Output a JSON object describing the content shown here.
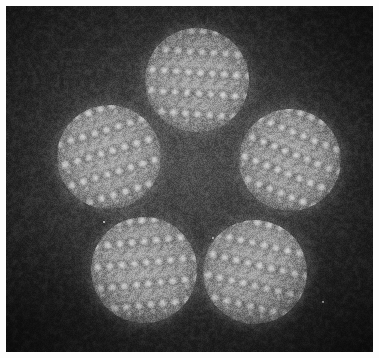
{
  "image": {
    "kind": "electron-micrograph",
    "modality": "high-resolution transmission electron microscopy",
    "subject": "five faceted nanocrystals arranged in a pentagonal cluster, each resolving its atomic lattice",
    "width_px": 379,
    "height_px": 358,
    "frame": {
      "margin_px": 6,
      "margin_color": "#fdfdfd",
      "field_color": "#2b2b2b"
    },
    "tone": {
      "background_gray": "#2b2b2b",
      "background_gray_light": "#3a3a3a",
      "particle_mid_gray": "#a8a8a8",
      "atom_highlight_gray": "#d8d8d8",
      "atom_shadow_gray": "#6a6a6a",
      "brightest": "#e8e8e8",
      "darkest": "#1c1c1c"
    },
    "lattice": {
      "type": "hexagonal",
      "spacing_px": 12,
      "dot_radius_px": 3.2,
      "description": "bright dot array of atomic columns"
    },
    "particles": [
      {
        "id": "particle-top",
        "label": "top nanocrystal",
        "cx": 197,
        "cy": 80,
        "diameter": 104,
        "lattice_rotation_deg": 4,
        "lattice_spacing_px": 12.0
      },
      {
        "id": "particle-left",
        "label": "left nanocrystal",
        "cx": 109,
        "cy": 157,
        "diameter": 104,
        "lattice_rotation_deg": -17,
        "lattice_spacing_px": 12.4
      },
      {
        "id": "particle-right",
        "label": "right nanocrystal",
        "cx": 290,
        "cy": 160,
        "diameter": 102,
        "lattice_rotation_deg": 22,
        "lattice_spacing_px": 11.8
      },
      {
        "id": "particle-bottom-left",
        "label": "bottom-left nanocrystal",
        "cx": 144,
        "cy": 270,
        "diameter": 106,
        "lattice_rotation_deg": -6,
        "lattice_spacing_px": 12.2
      },
      {
        "id": "particle-bottom-right",
        "label": "bottom-right nanocrystal",
        "cx": 255,
        "cy": 272,
        "diameter": 104,
        "lattice_rotation_deg": 13,
        "lattice_spacing_px": 12.0
      }
    ],
    "specks": [
      {
        "id": "speck-center",
        "x": 213,
        "y": 238,
        "size": 2.4
      },
      {
        "id": "speck-lower-right",
        "x": 323,
        "y": 302,
        "size": 2.2
      },
      {
        "id": "speck-upper-left",
        "x": 104,
        "y": 222,
        "size": 2.0
      }
    ],
    "annotations": {
      "scale_bar": null,
      "labels": [],
      "caption": ""
    }
  }
}
